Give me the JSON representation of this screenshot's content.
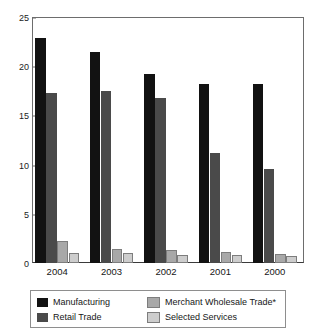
{
  "chart_data": {
    "type": "bar",
    "title": "",
    "subtitle": "",
    "xlabel": "",
    "ylabel": "",
    "ylim": [
      0,
      25
    ],
    "yticks": [
      "0",
      "5",
      "10",
      "15",
      "20",
      "25"
    ],
    "grid": false,
    "legend_position": "bottom",
    "categories": [
      "2004",
      "2003",
      "2002",
      "2001",
      "2000"
    ],
    "series": [
      {
        "name": "Manufacturing",
        "color": "#121212",
        "values": [
          22.9,
          21.4,
          19.2,
          18.2,
          18.2
        ]
      },
      {
        "name": "Retail Trade",
        "color": "#4a4a4a",
        "values": [
          17.3,
          17.5,
          16.8,
          11.2,
          9.6
        ]
      },
      {
        "name": "Merchant Wholesale Trade*",
        "color": "#a8a8a8",
        "values": [
          2.2,
          1.4,
          1.3,
          1.1,
          0.9
        ]
      },
      {
        "name": "Selected Services",
        "color": "#cdcdcd",
        "values": [
          1.0,
          1.0,
          0.85,
          0.85,
          0.75
        ]
      }
    ]
  },
  "legend": {
    "entries": [
      {
        "label": "Manufacturing",
        "color": "#121212"
      },
      {
        "label": "Retail Trade",
        "color": "#4a4a4a"
      },
      {
        "label": "Merchant Wholesale Trade*",
        "color": "#a8a8a8"
      },
      {
        "label": "Selected Services",
        "color": "#cdcdcd"
      }
    ]
  },
  "axes": {
    "y_max_label": "25",
    "y_min_label": "0"
  }
}
